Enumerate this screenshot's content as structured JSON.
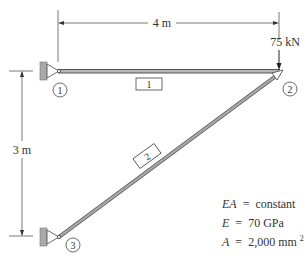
{
  "diagram": {
    "type": "two-member truss",
    "dimensions": {
      "horizontal": "4 m",
      "vertical": "3 m"
    },
    "load": {
      "label": "75 kN",
      "node": "2",
      "direction": "down"
    },
    "nodes": [
      {
        "id": "1",
        "label": "1",
        "support": "pin-wall"
      },
      {
        "id": "2",
        "label": "2",
        "support": "free"
      },
      {
        "id": "3",
        "label": "3",
        "support": "pin-wall"
      }
    ],
    "members": [
      {
        "id": "1",
        "label": "1",
        "from": "1",
        "to": "2"
      },
      {
        "id": "2",
        "label": "2",
        "from": "3",
        "to": "2"
      }
    ],
    "properties": {
      "line1": {
        "lhs": "EA",
        "op": "=",
        "rhs": "constant"
      },
      "line2": {
        "lhs": "E",
        "op": "=",
        "rhs": "70 GPa"
      },
      "line3": {
        "lhs": "A",
        "op": "=",
        "rhs": "2,000 mm",
        "sup": "2"
      }
    },
    "colors": {
      "member": "#9a9a9a",
      "member_edge": "#555555",
      "wall": "#a9a9a9",
      "text": "#333333"
    }
  }
}
